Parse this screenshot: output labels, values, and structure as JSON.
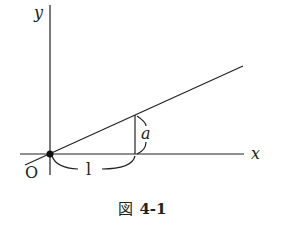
{
  "figure": {
    "axes": {
      "x_label": "x",
      "y_label": "y",
      "origin_label": "O"
    },
    "annotations": {
      "run_label": "l",
      "rise_label": "a"
    },
    "caption": {
      "prefix": "図",
      "number": "4-1"
    },
    "colors": {
      "stroke": "#222222",
      "background": "#ffffff"
    }
  }
}
